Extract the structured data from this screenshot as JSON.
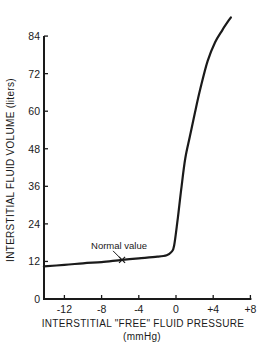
{
  "chart_data": {
    "type": "line",
    "title": "",
    "xlabel": "INTERSTITIAL \"FREE\" FLUID PRESSURE",
    "xlabel_units": "(mmHg)",
    "ylabel": "INTERSTITIAL FLUID VOLUME (liters)",
    "xlim": [
      -14.2,
      8
    ],
    "ylim": [
      0,
      84
    ],
    "x_ticks": [
      -12,
      -8,
      -4,
      0,
      4,
      8
    ],
    "x_tick_labels": [
      "-12",
      "-8",
      "-4",
      "0",
      "+4",
      "+8"
    ],
    "y_ticks": [
      0,
      12,
      24,
      36,
      48,
      60,
      72,
      84
    ],
    "y_tick_labels": [
      "0",
      "12",
      "24",
      "36",
      "48",
      "60",
      "72",
      "84"
    ],
    "grid": false,
    "legend": null,
    "series": [
      {
        "name": "Interstitial fluid volume",
        "color": "#1a1a1a",
        "x": [
          -14.2,
          -12,
          -10,
          -8,
          -5.8,
          -4,
          -2,
          -1,
          -0.5,
          -0.2,
          0.2,
          0.6,
          1.0,
          1.5,
          2.0,
          2.6,
          3.4,
          4.2,
          5.0,
          5.9
        ],
        "y": [
          10.4,
          10.9,
          11.4,
          11.8,
          12.5,
          13.0,
          13.5,
          14.0,
          15.0,
          17.0,
          26.0,
          36.0,
          45.0,
          52.0,
          59.0,
          67.0,
          76.0,
          82.0,
          86.0,
          90.0
        ]
      }
    ],
    "annotations": [
      {
        "text": "Normal value",
        "marker": "x",
        "x": -5.8,
        "y": 12.5
      }
    ]
  }
}
